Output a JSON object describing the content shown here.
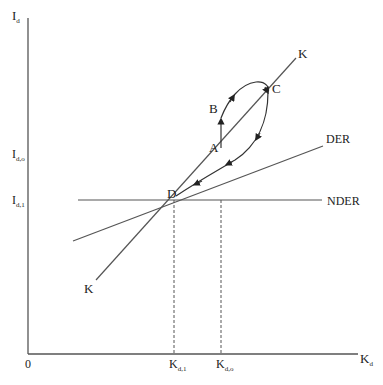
{
  "diagram": {
    "axes": {
      "y_label": "I",
      "y_label_sub": "d",
      "x_label": "K",
      "x_label_sub": "d",
      "origin": "0"
    },
    "y_ticks": [
      {
        "main": "I",
        "sub": "d,o"
      },
      {
        "main": "I",
        "sub": "d,1"
      }
    ],
    "x_ticks": [
      {
        "main": "K",
        "sub": "d,1"
      },
      {
        "main": "K",
        "sub": "d,o"
      }
    ],
    "lines": {
      "k_top": "K",
      "k_bottom": "K",
      "der": "DER",
      "nder": "NDER"
    },
    "points": {
      "a": "A",
      "b": "B",
      "c": "C",
      "d": "D"
    },
    "colors": {
      "line": "#555555",
      "text": "#222222",
      "background": "#ffffff"
    }
  }
}
